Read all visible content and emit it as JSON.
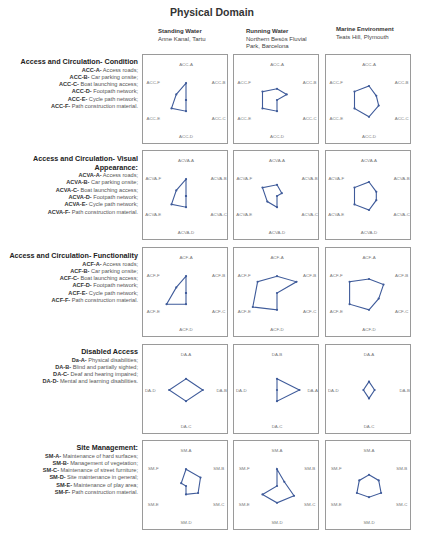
{
  "title": "Physical Domain",
  "columns": [
    {
      "name": "Standing Water",
      "subtitle": "Anne Kanal, Tartu"
    },
    {
      "name": "Running Water",
      "subtitle": "Northern Besòs Fluvial Park, Barcelona"
    },
    {
      "name": "Marine Environment",
      "subtitle": "Teats Hill, Plymouth"
    }
  ],
  "colors": {
    "line": "#3f5b9a",
    "box_border": "#9a9a9a"
  },
  "sections": [
    {
      "heading": "Access and Circulation- Condition",
      "items": [
        {
          "code": "ACC-A-",
          "text": " Access roads;"
        },
        {
          "code": "ACC-B-",
          "text": " Car parking onsite;"
        },
        {
          "code": "ACC-C-",
          "text": " Boat launching access;"
        },
        {
          "code": "ACC-D-",
          "text": " Footpath network;"
        },
        {
          "code": "ACC-E-",
          "text": " Cycle path network;"
        },
        {
          "code": "ACC-F-",
          "text": " Path construction material."
        }
      ]
    },
    {
      "heading": "Access and Circulation- Visual Appearance:",
      "items": [
        {
          "code": "ACVA-A-",
          "text": " Access roads;"
        },
        {
          "code": "ACVA-B-",
          "text": " Car parking onsite;"
        },
        {
          "code": "ACVA-C-",
          "text": " Boat launching access;"
        },
        {
          "code": "ACVA-D-",
          "text": " Footpath network;"
        },
        {
          "code": "ACVA-E-",
          "text": " Cycle path network;"
        },
        {
          "code": "ACVA-F-",
          "text": " Path construction material."
        }
      ]
    },
    {
      "heading": "Access and Circulation- Functionality",
      "items": [
        {
          "code": "ACF-A-",
          "text": " Access roads;"
        },
        {
          "code": "ACF-B-",
          "text": " Car parking onsite;"
        },
        {
          "code": "ACF-C-",
          "text": " Boat launching access;"
        },
        {
          "code": "ACF-D-",
          "text": " Footpath network;"
        },
        {
          "code": "ACF-E-",
          "text": " Cycle path network;"
        },
        {
          "code": "ACF-F-",
          "text": " Path construction material."
        }
      ]
    },
    {
      "heading": "Disabled Access",
      "items": [
        {
          "code": "Da-A-",
          "text": " Physical disabilities;"
        },
        {
          "code": "DA-B-",
          "text": " Blind and partially sighted;"
        },
        {
          "code": "DA-C-",
          "text": " Deaf and hearing impaired;"
        },
        {
          "code": "DA-D-",
          "text": " Mental and learning disabilities."
        }
      ]
    },
    {
      "heading": "Site Management:",
      "items": [
        {
          "code": "SM-A-",
          "text": " Maintenance of hard surfaces;"
        },
        {
          "code": "SM-B-",
          "text": " Management of vegetation;"
        },
        {
          "code": "SM-C-",
          "text": " Maintenance of street furniture;"
        },
        {
          "code": "SM-D-",
          "text": " Site maintenance in general;"
        },
        {
          "code": "SM-E-",
          "text": " Maintenance of play area;"
        },
        {
          "code": "SM-F-",
          "text": " Path construction material."
        }
      ]
    }
  ],
  "chart_data": [
    {
      "type": "radar",
      "section": "Access and Circulation- Condition",
      "site": "Standing Water",
      "axes": [
        "ACC-A",
        "ACC-B",
        "ACC-C",
        "ACC-D",
        "ACC-E",
        "ACC-F"
      ],
      "values": [
        3,
        0,
        0,
        2,
        3,
        2
      ],
      "rmax": 5,
      "grid": false
    },
    {
      "type": "radar",
      "section": "Access and Circulation- Condition",
      "site": "Running Water",
      "axes": [
        "ACC-A",
        "ACC-B",
        "ACC-C",
        "ACC-D",
        "ACC-E",
        "ACC-F"
      ],
      "values": [
        2,
        2,
        0,
        2,
        3,
        3
      ],
      "rmax": 5,
      "grid": false
    },
    {
      "type": "radar",
      "section": "Access and Circulation- Condition",
      "site": "Marine Environment",
      "axes": [
        "ACC-A",
        "ACC-B",
        "ACC-C",
        "ACC-D",
        "ACC-E",
        "ACC-F"
      ],
      "values": [
        2.5,
        1.5,
        2,
        3,
        3,
        3
      ],
      "rmax": 5,
      "grid": false
    },
    {
      "type": "radar",
      "section": "Access and Circulation- Visual Appearance",
      "site": "Standing Water",
      "axes": [
        "ACVA-A",
        "ACVA-B",
        "ACVA-C",
        "ACVA-D",
        "ACVA-E",
        "ACVA-F"
      ],
      "values": [
        3,
        0,
        0,
        2,
        3,
        2
      ],
      "rmax": 5,
      "grid": false
    },
    {
      "type": "radar",
      "section": "Access and Circulation- Visual Appearance",
      "site": "Running Water",
      "axes": [
        "ACVA-A",
        "ACVA-B",
        "ACVA-C",
        "ACVA-D",
        "ACVA-E",
        "ACVA-F"
      ],
      "values": [
        2,
        1,
        0,
        2,
        2,
        3
      ],
      "rmax": 5,
      "grid": false
    },
    {
      "type": "radar",
      "section": "Access and Circulation- Visual Appearance",
      "site": "Marine Environment",
      "axes": [
        "ACVA-A",
        "ACVA-B",
        "ACVA-C",
        "ACVA-D",
        "ACVA-E",
        "ACVA-F"
      ],
      "values": [
        2.5,
        1.5,
        1.5,
        2.5,
        3,
        3
      ],
      "rmax": 5,
      "grid": false
    },
    {
      "type": "radar",
      "section": "Access and Circulation- Functionality",
      "site": "Standing Water",
      "axes": [
        "ACF-A",
        "ACF-B",
        "ACF-C",
        "ACF-D",
        "ACF-E",
        "ACF-F"
      ],
      "values": [
        3,
        0,
        0,
        2,
        4,
        2
      ],
      "rmax": 5,
      "grid": false
    },
    {
      "type": "radar",
      "section": "Access and Circulation- Functionality",
      "site": "Running Water",
      "axes": [
        "ACF-A",
        "ACF-B",
        "ACF-C",
        "ACF-D",
        "ACF-E",
        "ACF-F"
      ],
      "values": [
        3,
        4,
        0,
        3,
        5,
        4
      ],
      "rmax": 5,
      "grid": false
    },
    {
      "type": "radar",
      "section": "Access and Circulation- Functionality",
      "site": "Marine Environment",
      "axes": [
        "ACF-A",
        "ACF-B",
        "ACF-C",
        "ACF-D",
        "ACF-E",
        "ACF-F"
      ],
      "values": [
        2.5,
        3,
        2,
        3,
        4,
        4
      ],
      "rmax": 5,
      "grid": false
    },
    {
      "type": "radar",
      "section": "Disabled Access",
      "site": "Standing Water",
      "axes": [
        "DA-A",
        "DA-B",
        "DA-C",
        "DA-D"
      ],
      "values": [
        2,
        3,
        2,
        3
      ],
      "rmax": 5,
      "grid": false
    },
    {
      "type": "radar",
      "section": "Disabled Access",
      "site": "Running Water",
      "axes": [
        "DA-B",
        "DA-A",
        "DA-C",
        "DA-D"
      ],
      "values": [
        2,
        4,
        2,
        0
      ],
      "rmax": 5,
      "grid": false
    },
    {
      "type": "radar",
      "section": "Disabled Access",
      "site": "Marine Environment",
      "axes": [
        "DA-A",
        "DA-B",
        "DA-C",
        "DA-D"
      ],
      "values": [
        1.5,
        1,
        1.5,
        1
      ],
      "rmax": 5,
      "grid": false
    },
    {
      "type": "radar",
      "section": "Site Management",
      "site": "Standing Water",
      "axes": [
        "SM-A",
        "SM-B",
        "SM-C",
        "SM-D",
        "SM-E",
        "SM-F"
      ],
      "values": [
        3,
        3,
        2.5,
        1.5,
        0,
        1
      ],
      "rmax": 5,
      "grid": false
    },
    {
      "type": "radar",
      "section": "Site Management",
      "site": "Running Water",
      "axes": [
        "SM-A",
        "SM-B",
        "SM-C",
        "SM-D",
        "SM-E",
        "SM-F"
      ],
      "values": [
        3,
        1.5,
        3.5,
        3,
        3,
        0
      ],
      "rmax": 5,
      "grid": false
    },
    {
      "type": "radar",
      "section": "Site Management",
      "site": "Marine Environment",
      "axes": [
        "SM-A",
        "SM-B",
        "SM-C",
        "SM-D",
        "SM-E",
        "SM-F"
      ],
      "values": [
        2,
        2,
        2.5,
        2,
        2.5,
        2
      ],
      "rmax": 5,
      "grid": false
    }
  ]
}
